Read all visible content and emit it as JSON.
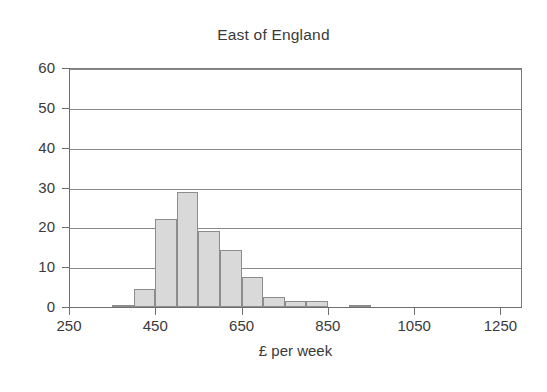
{
  "chart_data": {
    "type": "bar",
    "title": "East of England",
    "xlabel": "£ per week",
    "ylabel": "",
    "grid": true,
    "legend": false,
    "xlim": [
      250,
      1300
    ],
    "ylim": [
      0,
      60
    ],
    "bin_width": 50,
    "xticks": [
      250,
      450,
      650,
      850,
      1050,
      1250
    ],
    "xtick_labels": [
      "250",
      "450",
      "650",
      "850",
      "1050",
      "1250"
    ],
    "yticks": [
      0,
      10,
      20,
      30,
      40,
      50,
      60
    ],
    "ytick_labels": [
      "0",
      "10",
      "20",
      "30",
      "40",
      "50",
      "60"
    ],
    "bins": [
      {
        "start": 350,
        "end": 400,
        "value": 0.3
      },
      {
        "start": 400,
        "end": 450,
        "value": 4.5
      },
      {
        "start": 450,
        "end": 500,
        "value": 22.0
      },
      {
        "start": 500,
        "end": 550,
        "value": 28.8
      },
      {
        "start": 550,
        "end": 600,
        "value": 19.0
      },
      {
        "start": 600,
        "end": 650,
        "value": 14.3
      },
      {
        "start": 650,
        "end": 700,
        "value": 7.6
      },
      {
        "start": 700,
        "end": 750,
        "value": 2.6
      },
      {
        "start": 750,
        "end": 800,
        "value": 1.4
      },
      {
        "start": 800,
        "end": 850,
        "value": 1.4
      },
      {
        "start": 900,
        "end": 950,
        "value": 0.4
      }
    ],
    "categories": [
      "350-400",
      "400-450",
      "450-500",
      "500-550",
      "550-600",
      "600-650",
      "650-700",
      "700-750",
      "750-800",
      "800-850",
      "900-950"
    ],
    "values": [
      0.3,
      4.5,
      22.0,
      28.8,
      19.0,
      14.3,
      7.6,
      2.6,
      1.4,
      1.4,
      0.4
    ],
    "colors": {
      "bar_fill": "#d9d9d9",
      "bar_edge": "#8c8c8c",
      "gridline": "#8a8a8a",
      "axis": "#6f6f6f",
      "text": "#3a3a3a",
      "background": "#ffffff"
    }
  }
}
